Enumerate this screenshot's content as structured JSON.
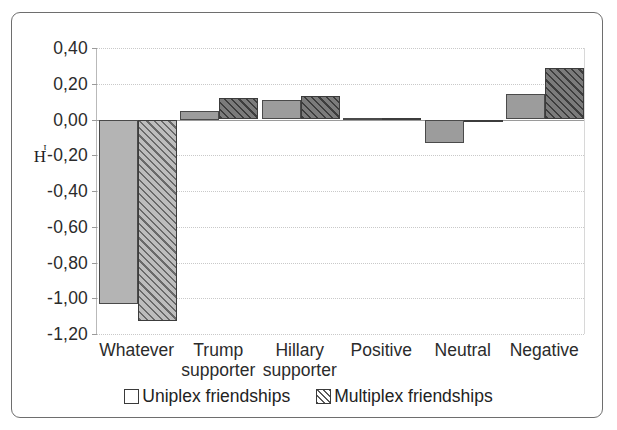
{
  "chart_data": {
    "type": "bar",
    "title": "",
    "xlabel": "",
    "ylabel": "Hⁱ",
    "ylabel_main": "H",
    "ylabel_sub": "i",
    "ylim": [
      -1.2,
      0.4
    ],
    "ytick_labels": [
      "0,40",
      "0,20",
      "0,00",
      "-0,20",
      "-0,40",
      "-0,60",
      "-0,80",
      "-1,00",
      "-1,20"
    ],
    "ytick_values": [
      0.4,
      0.2,
      0.0,
      -0.2,
      -0.4,
      -0.6,
      -0.8,
      -1.0,
      -1.2
    ],
    "grid": true,
    "legend_position": "bottom",
    "categories": [
      "Whatever",
      "Trump supporter",
      "Hillary supporter",
      "Positive",
      "Neutral",
      "Negative"
    ],
    "category_lines": [
      [
        "Whatever",
        ""
      ],
      [
        "Trump",
        "supporter"
      ],
      [
        "Hillary",
        "supporter"
      ],
      [
        "Positive",
        ""
      ],
      [
        "Neutral",
        ""
      ],
      [
        "Negative",
        ""
      ]
    ],
    "series": [
      {
        "name": "Uniplex friendships",
        "values": [
          -1.03,
          0.05,
          0.11,
          0.01,
          -0.13,
          0.14
        ]
      },
      {
        "name": "Multiplex friendships",
        "values": [
          -1.13,
          0.12,
          0.13,
          0.01,
          -0.01,
          0.29
        ]
      }
    ]
  },
  "legend": {
    "entries": [
      {
        "label": "Uniplex friendships",
        "swatch": "plain-swatch"
      },
      {
        "label": "Multiplex friendships",
        "swatch": "hatched-swatch"
      }
    ]
  },
  "colors": {
    "uniplex_fill": "#9c9c9c",
    "multiplex_fill": "#7b7b7b",
    "bar_border": "#3c3c3c",
    "grid": "#c9c9c9",
    "axis": "#9a9a9a",
    "text": "#2b2b2b",
    "frame": "#6e6e6e",
    "background": "#ffffff"
  }
}
